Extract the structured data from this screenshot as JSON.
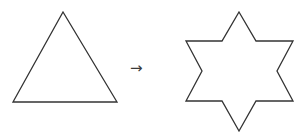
{
  "figure": {
    "background_color": "#ffffff",
    "stroke_color": "#333333",
    "stroke_width": 1.3,
    "width": 303,
    "height": 140,
    "connector": {
      "name": "right-arrow",
      "glyph": "→",
      "label": "transforms into",
      "color": "#3a3a3a",
      "x": 130,
      "y": 61
    },
    "shapes": [
      {
        "id": "source-shape",
        "name": "triangle",
        "label": "Triangle",
        "sides": 3,
        "fill": "none",
        "points": "63,12 117,102 13,102",
        "vertices": [
          {
            "label": "apex",
            "x": 63,
            "y": 12
          },
          {
            "label": "base-right",
            "x": 117,
            "y": 102
          },
          {
            "label": "base-left",
            "x": 13,
            "y": 102
          }
        ]
      },
      {
        "id": "target-shape",
        "name": "six-pointed-star",
        "label": "Six-pointed star",
        "points_count": 6,
        "fill": "none",
        "points": "239,12 256,41 293,41 277,71 293,101 256,101 239,131 222,101 186,101 202,71 186,41 222,41",
        "vertices": [
          {
            "label": "top-point",
            "x": 239,
            "y": 12
          },
          {
            "label": "inner-upper-right",
            "x": 256,
            "y": 41
          },
          {
            "label": "upper-right-point",
            "x": 293,
            "y": 41
          },
          {
            "label": "inner-right",
            "x": 277,
            "y": 71
          },
          {
            "label": "lower-right-point",
            "x": 293,
            "y": 101
          },
          {
            "label": "inner-lower-right",
            "x": 256,
            "y": 101
          },
          {
            "label": "bottom-point",
            "x": 239,
            "y": 131
          },
          {
            "label": "inner-lower-left",
            "x": 222,
            "y": 101
          },
          {
            "label": "lower-left-point",
            "x": 186,
            "y": 101
          },
          {
            "label": "inner-left",
            "x": 202,
            "y": 71
          },
          {
            "label": "upper-left-point",
            "x": 186,
            "y": 41
          },
          {
            "label": "inner-upper-left",
            "x": 222,
            "y": 41
          }
        ]
      }
    ]
  }
}
